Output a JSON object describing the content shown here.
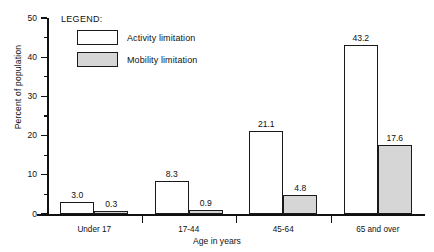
{
  "chart_data": {
    "type": "bar",
    "title": "",
    "xlabel": "Age in years",
    "ylabel": "Percent of population",
    "categories": [
      "Under 17",
      "17-44",
      "45-64",
      "65 and over"
    ],
    "series": [
      {
        "name": "Activity limitation",
        "values": [
          3.0,
          8.3,
          21.1,
          43.2
        ],
        "color": "#ffffff"
      },
      {
        "name": "Mobility limitation",
        "values": [
          0.3,
          0.9,
          4.8,
          17.6
        ],
        "color": "#d6d6d6"
      }
    ],
    "value_labels": [
      [
        "3.0",
        "0.3"
      ],
      [
        "8.3",
        "0.9"
      ],
      [
        "21.1",
        "4.8"
      ],
      [
        "43.2",
        "17.6"
      ]
    ],
    "ylim": [
      0,
      50
    ],
    "yticks": [
      0,
      10,
      20,
      30,
      40,
      50
    ],
    "ytick_labels": [
      "0",
      "10",
      "20",
      "30",
      "40",
      "50"
    ],
    "yminor_ticks": [
      5,
      15,
      25,
      35,
      45
    ],
    "grid": false,
    "legend_position": "upper-left-inside"
  },
  "legend": {
    "title": "LEGEND:",
    "items": [
      {
        "label": "Activity limitation",
        "swatch": "white-box"
      },
      {
        "label": "Mobility limitation",
        "swatch": "gray-box"
      }
    ]
  },
  "axes": {
    "y_title": "Percent of population",
    "x_title": "Age in years"
  }
}
